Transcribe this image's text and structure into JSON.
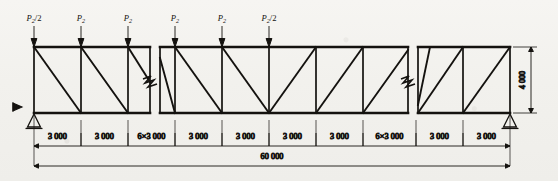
{
  "figure": {
    "type": "structural-truss-diagram",
    "title": "",
    "colors": {
      "line": "#14120f",
      "background": "#f2f1ed",
      "dimension": "#14120f"
    }
  },
  "loads": {
    "symbol_base": "P",
    "subscript": "2",
    "items": [
      {
        "id": "load-1",
        "label": "P2/2",
        "base": "P",
        "sub": "2",
        "suffix": "/2",
        "x": 34
      },
      {
        "id": "load-2",
        "label": "P2",
        "base": "P",
        "sub": "2",
        "suffix": "",
        "x": 81
      },
      {
        "id": "load-3",
        "label": "P2",
        "base": "P",
        "sub": "2",
        "suffix": "",
        "x": 128
      },
      {
        "id": "load-4",
        "label": "P2",
        "base": "P",
        "sub": "2",
        "suffix": "",
        "x": 175
      },
      {
        "id": "load-5",
        "label": "P2",
        "base": "P",
        "sub": "2",
        "suffix": "",
        "x": 222
      },
      {
        "id": "load-6",
        "label": "P2/2",
        "base": "P",
        "sub": "2",
        "suffix": "/2",
        "x": 269
      }
    ],
    "direction": "down",
    "count": 6
  },
  "truss": {
    "span_label": "60 000",
    "height_label": "4 000",
    "top_chord": "top-chord",
    "bottom_chord": "bottom-chord",
    "panel_count": 20,
    "panel_spacing": "3 000"
  },
  "dimensions": {
    "chain": [
      {
        "id": "dim-1",
        "label": "3 000"
      },
      {
        "id": "dim-2",
        "label": "3 000"
      },
      {
        "id": "dim-3",
        "label": "6×3 000"
      },
      {
        "id": "dim-4",
        "label": "3 000"
      },
      {
        "id": "dim-5",
        "label": "3 000"
      },
      {
        "id": "dim-6",
        "label": "3 000"
      },
      {
        "id": "dim-7",
        "label": "3 000"
      },
      {
        "id": "dim-8",
        "label": "6×3 000"
      },
      {
        "id": "dim-9",
        "label": "3 000"
      },
      {
        "id": "dim-10",
        "label": "3 000"
      }
    ],
    "overall": {
      "id": "dim-overall",
      "label": "60 000"
    },
    "vertical": {
      "id": "dim-height",
      "label": "4 000"
    }
  },
  "supports": {
    "left": {
      "type": "pin-support",
      "label": ""
    },
    "right": {
      "type": "roller-support",
      "label": ""
    }
  },
  "breaks": [
    {
      "id": "break-left",
      "x": 155
    },
    {
      "id": "break-right",
      "x": 413
    }
  ]
}
